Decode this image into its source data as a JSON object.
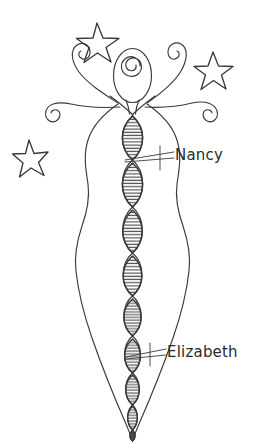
{
  "artwork": {
    "title": "Hand-drawn goddess figure with DNA spine",
    "background_color": "#ffffff",
    "ink_color": "#3a3a3a",
    "medium": "pen and ink line drawing"
  },
  "labels": [
    {
      "id": "nancy",
      "text": "Nancy",
      "points_to": "upper-dna-helix-segment",
      "color": "#2b2b2b"
    },
    {
      "id": "elizabeth",
      "text": "Elizabeth",
      "points_to": "lower-dna-helix-segment",
      "color": "#2b2b2b"
    }
  ],
  "figure": {
    "head": {
      "shape": "oval",
      "interior": "spiral"
    },
    "arms": {
      "count": 4,
      "style": "curled-spiral-tendrils",
      "crossing": "x-cross-at-shoulders"
    },
    "body": {
      "shape": "hourglass-silhouette-tapering-to-point",
      "sides": "wavy"
    },
    "spine": {
      "type": "dna-double-helix",
      "segment_count": 9,
      "segment_shape": "lens",
      "fill": "horizontal-rungs"
    }
  },
  "stars": [
    {
      "id": "star-top-left",
      "points": 5,
      "style": "outline-hand-drawn"
    },
    {
      "id": "star-top-right",
      "points": 5,
      "style": "outline-hand-drawn"
    },
    {
      "id": "star-mid-left",
      "points": 5,
      "style": "outline-hand-drawn"
    }
  ]
}
